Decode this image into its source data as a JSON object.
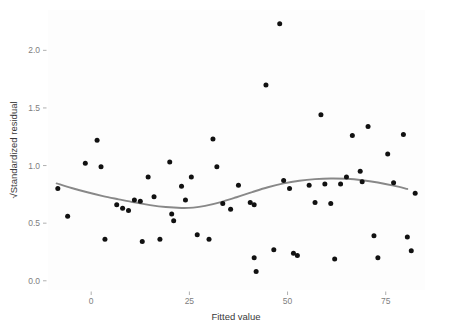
{
  "chart_data": {
    "type": "scatter",
    "title": "",
    "xlabel": "Fitted value",
    "ylabel": "√Standardized residual",
    "xlim": [
      -11,
      85
    ],
    "ylim": [
      -0.08,
      2.35
    ],
    "xticks": [
      0,
      25,
      50,
      75
    ],
    "xticklabels": [
      "0",
      "25",
      "50",
      "75"
    ],
    "yticks": [
      0.0,
      0.5,
      1.0,
      1.5,
      2.0
    ],
    "yticklabels": [
      "0.0",
      "0.5",
      "1.0",
      "1.5",
      "2.0"
    ],
    "grid": false,
    "legend": null,
    "point_color": "#111111",
    "smooth_color": "#888888",
    "panel_color": "#fdfdfd",
    "axis_text_color": "#808080",
    "axis_title_color": "#3a3a3a",
    "points": [
      {
        "x": -8.5,
        "y": 0.8
      },
      {
        "x": -6.0,
        "y": 0.56
      },
      {
        "x": -1.5,
        "y": 1.02
      },
      {
        "x": 1.5,
        "y": 1.22
      },
      {
        "x": 2.5,
        "y": 0.99
      },
      {
        "x": 3.5,
        "y": 0.36
      },
      {
        "x": 6.5,
        "y": 0.66
      },
      {
        "x": 8.0,
        "y": 0.63
      },
      {
        "x": 9.5,
        "y": 0.61
      },
      {
        "x": 11.0,
        "y": 0.7
      },
      {
        "x": 12.5,
        "y": 0.69
      },
      {
        "x": 13.0,
        "y": 0.34
      },
      {
        "x": 14.5,
        "y": 0.9
      },
      {
        "x": 16.0,
        "y": 0.73
      },
      {
        "x": 17.5,
        "y": 0.36
      },
      {
        "x": 20.0,
        "y": 1.03
      },
      {
        "x": 20.5,
        "y": 0.58
      },
      {
        "x": 21.0,
        "y": 0.52
      },
      {
        "x": 23.0,
        "y": 0.82
      },
      {
        "x": 24.0,
        "y": 0.7
      },
      {
        "x": 25.5,
        "y": 0.9
      },
      {
        "x": 27.0,
        "y": 0.4
      },
      {
        "x": 30.0,
        "y": 0.36
      },
      {
        "x": 31.0,
        "y": 1.23
      },
      {
        "x": 32.0,
        "y": 0.99
      },
      {
        "x": 33.5,
        "y": 0.67
      },
      {
        "x": 35.5,
        "y": 0.62
      },
      {
        "x": 37.5,
        "y": 0.83
      },
      {
        "x": 40.5,
        "y": 0.68
      },
      {
        "x": 41.5,
        "y": 0.66
      },
      {
        "x": 41.5,
        "y": 0.2
      },
      {
        "x": 42.0,
        "y": 0.08
      },
      {
        "x": 44.5,
        "y": 1.7
      },
      {
        "x": 46.5,
        "y": 0.27
      },
      {
        "x": 48.0,
        "y": 2.23
      },
      {
        "x": 49.0,
        "y": 0.87
      },
      {
        "x": 50.5,
        "y": 0.8
      },
      {
        "x": 51.5,
        "y": 0.24
      },
      {
        "x": 52.5,
        "y": 0.22
      },
      {
        "x": 55.5,
        "y": 0.83
      },
      {
        "x": 57.0,
        "y": 0.68
      },
      {
        "x": 58.5,
        "y": 1.44
      },
      {
        "x": 59.5,
        "y": 0.84
      },
      {
        "x": 61.0,
        "y": 0.67
      },
      {
        "x": 62.0,
        "y": 0.19
      },
      {
        "x": 63.5,
        "y": 0.84
      },
      {
        "x": 65.0,
        "y": 0.9
      },
      {
        "x": 66.5,
        "y": 1.26
      },
      {
        "x": 68.5,
        "y": 0.95
      },
      {
        "x": 69.0,
        "y": 0.86
      },
      {
        "x": 70.5,
        "y": 1.34
      },
      {
        "x": 72.0,
        "y": 0.39
      },
      {
        "x": 73.0,
        "y": 0.2
      },
      {
        "x": 75.5,
        "y": 1.1
      },
      {
        "x": 77.0,
        "y": 0.85
      },
      {
        "x": 79.5,
        "y": 1.27
      },
      {
        "x": 80.5,
        "y": 0.38
      },
      {
        "x": 81.5,
        "y": 0.26
      },
      {
        "x": 82.5,
        "y": 0.76
      }
    ],
    "smooth": [
      {
        "x": -8.8,
        "y": 0.845
      },
      {
        "x": -5.0,
        "y": 0.805
      },
      {
        "x": -1.0,
        "y": 0.768
      },
      {
        "x": 3.0,
        "y": 0.735
      },
      {
        "x": 7.0,
        "y": 0.707
      },
      {
        "x": 11.0,
        "y": 0.68
      },
      {
        "x": 15.0,
        "y": 0.657
      },
      {
        "x": 19.0,
        "y": 0.64
      },
      {
        "x": 23.0,
        "y": 0.632
      },
      {
        "x": 26.0,
        "y": 0.635
      },
      {
        "x": 29.0,
        "y": 0.65
      },
      {
        "x": 33.0,
        "y": 0.683
      },
      {
        "x": 37.0,
        "y": 0.725
      },
      {
        "x": 41.0,
        "y": 0.77
      },
      {
        "x": 45.0,
        "y": 0.812
      },
      {
        "x": 49.0,
        "y": 0.845
      },
      {
        "x": 53.0,
        "y": 0.868
      },
      {
        "x": 57.0,
        "y": 0.882
      },
      {
        "x": 61.0,
        "y": 0.888
      },
      {
        "x": 65.0,
        "y": 0.885
      },
      {
        "x": 69.0,
        "y": 0.873
      },
      {
        "x": 73.0,
        "y": 0.853
      },
      {
        "x": 77.0,
        "y": 0.826
      },
      {
        "x": 80.5,
        "y": 0.797
      }
    ]
  }
}
